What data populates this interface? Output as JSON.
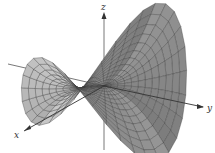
{
  "chart_data": {
    "type": "surface3d",
    "title": "",
    "axes": {
      "x": {
        "label": "x",
        "direction": "toward lower-left"
      },
      "y": {
        "label": "y",
        "direction": "toward right"
      },
      "z": {
        "label": "z",
        "direction": "up"
      }
    },
    "grid": false,
    "mesh": true,
    "surface_color": "#9a9a9a",
    "mesh_color": "#3a3a3a",
    "axis_color": "#444444"
  },
  "labels": {
    "x": "x",
    "y": "y",
    "z": "z"
  }
}
